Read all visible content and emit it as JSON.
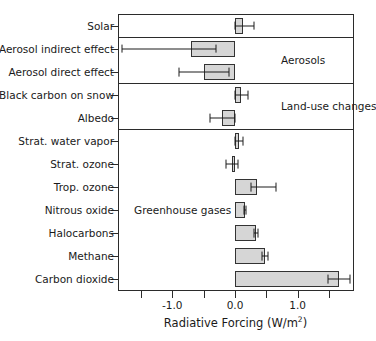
{
  "chart_data": {
    "type": "bar",
    "orientation": "horizontal",
    "title": "",
    "xlabel": "Radiative Forcing (W/m2)",
    "xlabel_parts": {
      "base": "Radiative Forcing (W/m",
      "sup": "2",
      "tail": ")"
    },
    "ylabel": "",
    "xlim": [
      -1.85,
      1.93
    ],
    "xticks": [
      -1.5,
      -1.0,
      -0.5,
      0.0,
      0.5,
      1.0,
      1.5
    ],
    "xtick_labels": [
      "",
      "-1.0",
      "",
      "0.0",
      "",
      "1.0",
      ""
    ],
    "grid": false,
    "legend": "none",
    "categories": [
      "Solar",
      "Aerosol indirect effect",
      "Aerosol direct effect",
      "Black carbon on snow",
      "Albedo",
      "Strat. water vapor",
      "Strat. ozone",
      "Trop. ozone",
      "Nitrous oxide",
      "Halocarbons",
      "Methane",
      "Carbon dioxide"
    ],
    "values": [
      0.12,
      -0.7,
      -0.5,
      0.1,
      -0.2,
      0.07,
      -0.05,
      0.35,
      0.16,
      0.34,
      0.48,
      1.66
    ],
    "error_low": [
      0.0,
      -1.8,
      -0.9,
      0.0,
      -0.4,
      0.0,
      -0.15,
      0.25,
      0.14,
      0.31,
      0.43,
      1.49
    ],
    "error_high": [
      0.3,
      -0.3,
      -0.1,
      0.2,
      0.0,
      0.12,
      0.05,
      0.65,
      0.18,
      0.37,
      0.53,
      1.83
    ],
    "group_annotations": [
      {
        "label": "Aerosols",
        "row_span": [
          1,
          2
        ]
      },
      {
        "label": "Land-use changes",
        "row_span": [
          3,
          4
        ]
      },
      {
        "label": "Greenhouse gases",
        "row_span": [
          5,
          11
        ]
      }
    ],
    "separators_after_rows": [
      0,
      2,
      4
    ]
  },
  "style": {
    "bar_fill": "#d6d6d6",
    "bar_edge": "#333333",
    "error_color": "#1c1c1c",
    "axis_color": "#2b2b2b",
    "text_color": "#1a1a1a",
    "background": "#ffffff"
  }
}
